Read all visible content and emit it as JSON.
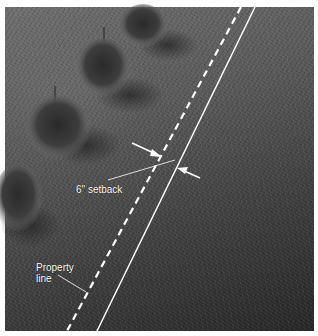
{
  "figure": {
    "labels": {
      "setback": "6\" setback",
      "property_line_1": "Property",
      "property_line_2": "line"
    },
    "lines": {
      "property_line": {
        "style": "solid",
        "color": "#ffffff"
      },
      "setback_line": {
        "style": "dashed",
        "color": "#ffffff"
      }
    },
    "colors": {
      "border": "#ffffff",
      "grass_light": "#6e6e6e",
      "grass_dark": "#262626"
    }
  }
}
